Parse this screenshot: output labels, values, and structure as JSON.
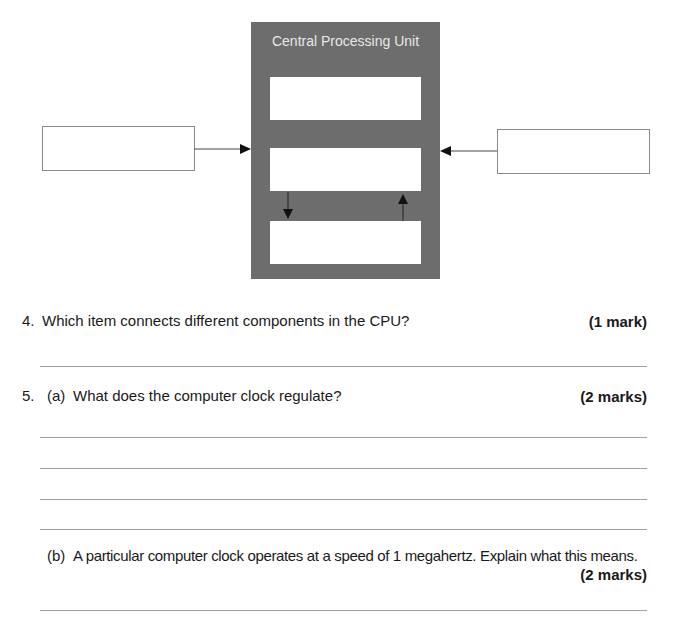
{
  "diagram": {
    "cpu_label": "Central Processing Unit",
    "inner_boxes": [
      "",
      "",
      ""
    ],
    "left_box": "",
    "right_box": "",
    "colors": {
      "cpu_fill": "#6d6d6d",
      "box_fill": "#ffffff",
      "arrow": "#111111"
    }
  },
  "questions": [
    {
      "number": "4.",
      "text": "Which item connects different components in the CPU?",
      "marks": "(1 mark)",
      "answer_lines": 1
    },
    {
      "number": "5.",
      "parts": [
        {
          "label": "(a)",
          "text": "What does the computer clock regulate?",
          "marks": "(2 marks)",
          "answer_lines": 4
        },
        {
          "label": "(b)",
          "text": "A particular computer clock operates at a speed of 1 megahertz.  Explain what this means.",
          "marks": "(2 marks)",
          "answer_lines": 1
        }
      ]
    }
  ]
}
